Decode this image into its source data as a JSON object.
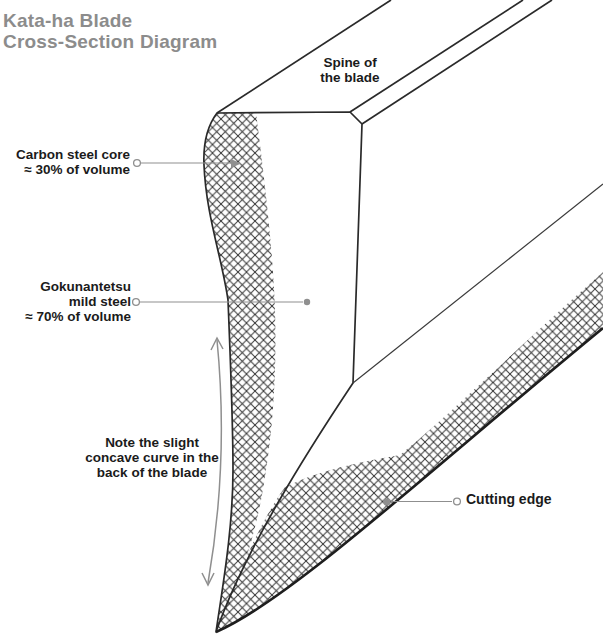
{
  "title": {
    "lines": [
      "Kata-ha Blade",
      "Cross-Section Diagram"
    ]
  },
  "labels": {
    "spine": {
      "lines": [
        "Spine of",
        "the blade"
      ]
    },
    "carbon_core": {
      "lines": [
        "Carbon steel core",
        "≈ 30% of volume"
      ]
    },
    "mild_steel": {
      "lines": [
        "Gokunantetsu",
        "mild steel",
        "≈ 70% of volume"
      ]
    },
    "concave_note": {
      "lines": [
        "Note the slight",
        "concave curve in the",
        "back of the blade"
      ]
    },
    "cutting_edge": {
      "text": "Cutting edge"
    }
  },
  "colors": {
    "title_text": "#8c8c8c",
    "label_text": "#1b1b1b",
    "blade_outline": "#2a2a2a",
    "cutting_edge_line": "#1e1e1e",
    "leader_lines": "#8f8f8f",
    "crosshatch": "#333333",
    "background": "#ffffff"
  }
}
